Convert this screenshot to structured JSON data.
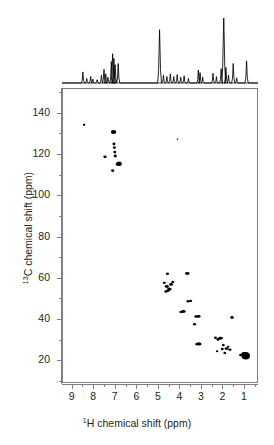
{
  "figure": {
    "title": "",
    "type": "2D HSQC NMR spectrum"
  },
  "axes": {
    "x": {
      "label_pre": "",
      "label_sup": "1",
      "label_main": "H chemical shift (ppm)",
      "label_full": "1H chemical shift (ppm)",
      "ticks": [
        9,
        8,
        7,
        6,
        5,
        4,
        3,
        2,
        1
      ],
      "tick_labels": [
        "9",
        "8",
        "7",
        "6",
        "5",
        "4",
        "3",
        "2",
        "1"
      ],
      "min": 9.45,
      "max": 0.35,
      "reversed": true,
      "minor_between": 1
    },
    "y": {
      "label_sup": "13",
      "label_main": "C chemical shift (ppm)",
      "label_full": "13C chemical shift (ppm)",
      "ticks": [
        20,
        40,
        60,
        80,
        100,
        120,
        140
      ],
      "tick_labels": [
        "20",
        "40",
        "60",
        "80",
        "100",
        "120",
        "140"
      ],
      "min": 9,
      "max": 152,
      "reversed": true,
      "minor_between": 1
    }
  },
  "chart_data": {
    "type": "scatter",
    "title": "",
    "xlabel": "1H chemical shift (ppm)",
    "ylabel": "13C chemical shift (ppm)",
    "xlim": [
      9.45,
      0.35
    ],
    "ylim": [
      152,
      9
    ],
    "grid": false,
    "legend": "none",
    "cross_peaks": [
      {
        "h": 0.88,
        "c": 21.8,
        "w": 8.5,
        "ht": 7.5
      },
      {
        "h": 0.95,
        "c": 22.4,
        "w": 6.0,
        "ht": 5.0
      },
      {
        "h": 0.8,
        "c": 22.0,
        "w": 5.0,
        "ht": 4.0
      },
      {
        "h": 1.12,
        "c": 22.2,
        "w": 3.0,
        "ht": 2.6
      },
      {
        "h": 1.52,
        "c": 40.5,
        "w": 3.6,
        "ht": 3.0
      },
      {
        "h": 1.62,
        "c": 24.8,
        "w": 3.2,
        "ht": 2.4
      },
      {
        "h": 1.78,
        "c": 25.3,
        "w": 4.2,
        "ht": 2.6
      },
      {
        "h": 1.7,
        "c": 26.2,
        "w": 2.6,
        "ht": 2.2
      },
      {
        "h": 1.86,
        "c": 23.2,
        "w": 2.8,
        "ht": 2.4
      },
      {
        "h": 1.93,
        "c": 27.0,
        "w": 3.0,
        "ht": 2.4
      },
      {
        "h": 1.98,
        "c": 25.1,
        "w": 3.0,
        "ht": 2.4
      },
      {
        "h": 2.06,
        "c": 30.4,
        "w": 5.0,
        "ht": 3.0
      },
      {
        "h": 2.18,
        "c": 29.8,
        "w": 3.2,
        "ht": 2.6
      },
      {
        "h": 2.22,
        "c": 24.0,
        "w": 2.6,
        "ht": 2.2
      },
      {
        "h": 2.3,
        "c": 30.6,
        "w": 3.0,
        "ht": 2.4
      },
      {
        "h": 3.08,
        "c": 27.6,
        "w": 5.5,
        "ht": 3.2
      },
      {
        "h": 3.18,
        "c": 27.5,
        "w": 3.0,
        "ht": 2.4
      },
      {
        "h": 3.1,
        "c": 41.0,
        "w": 4.5,
        "ht": 2.8
      },
      {
        "h": 3.22,
        "c": 41.0,
        "w": 3.0,
        "ht": 2.4
      },
      {
        "h": 3.28,
        "c": 37.2,
        "w": 3.2,
        "ht": 2.6
      },
      {
        "h": 3.46,
        "c": 48.6,
        "w": 3.0,
        "ht": 2.4
      },
      {
        "h": 3.58,
        "c": 48.4,
        "w": 3.2,
        "ht": 2.4
      },
      {
        "h": 3.62,
        "c": 62.0,
        "w": 4.5,
        "ht": 3.0
      },
      {
        "h": 3.8,
        "c": 43.4,
        "w": 4.5,
        "ht": 2.8
      },
      {
        "h": 3.92,
        "c": 43.2,
        "w": 3.0,
        "ht": 2.4
      },
      {
        "h": 4.3,
        "c": 57.8,
        "w": 3.0,
        "ht": 2.4
      },
      {
        "h": 4.38,
        "c": 56.6,
        "w": 4.0,
        "ht": 2.8
      },
      {
        "h": 4.46,
        "c": 54.4,
        "w": 4.6,
        "ht": 3.2
      },
      {
        "h": 4.52,
        "c": 53.6,
        "w": 3.6,
        "ht": 2.8
      },
      {
        "h": 4.58,
        "c": 55.6,
        "w": 4.2,
        "ht": 3.0
      },
      {
        "h": 4.62,
        "c": 53.2,
        "w": 3.2,
        "ht": 2.6
      },
      {
        "h": 4.55,
        "c": 61.8,
        "w": 3.2,
        "ht": 2.6
      },
      {
        "h": 4.7,
        "c": 57.4,
        "w": 3.0,
        "ht": 2.4
      },
      {
        "h": 6.82,
        "c": 115.5,
        "w": 5.5,
        "ht": 4.5
      },
      {
        "h": 6.9,
        "c": 115.3,
        "w": 3.2,
        "ht": 2.6
      },
      {
        "h": 7.0,
        "c": 119.3,
        "w": 3.2,
        "ht": 2.8
      },
      {
        "h": 7.02,
        "c": 121.2,
        "w": 3.0,
        "ht": 2.6
      },
      {
        "h": 7.04,
        "c": 123.4,
        "w": 3.0,
        "ht": 2.6
      },
      {
        "h": 7.06,
        "c": 125.2,
        "w": 3.0,
        "ht": 2.6
      },
      {
        "h": 7.08,
        "c": 131.0,
        "w": 5.5,
        "ht": 4.0
      },
      {
        "h": 7.12,
        "c": 112.2,
        "w": 3.2,
        "ht": 2.8
      },
      {
        "h": 7.48,
        "c": 118.9,
        "w": 3.4,
        "ht": 2.8
      },
      {
        "h": 8.46,
        "c": 134.5,
        "w": 2.6,
        "ht": 2.2
      },
      {
        "h": 4.08,
        "c": 127.5,
        "w": 1.6,
        "ht": 1.4
      }
    ],
    "projection_1d": {
      "axis": "1H",
      "description": "1D proton projection trace above the 2D plot",
      "peaks": [
        {
          "h": 8.48,
          "rel_intensity": 0.17
        },
        {
          "h": 8.3,
          "rel_intensity": 0.07
        },
        {
          "h": 8.12,
          "rel_intensity": 0.1
        },
        {
          "h": 8.02,
          "rel_intensity": 0.06
        },
        {
          "h": 7.82,
          "rel_intensity": 0.05
        },
        {
          "h": 7.62,
          "rel_intensity": 0.12
        },
        {
          "h": 7.5,
          "rel_intensity": 0.21
        },
        {
          "h": 7.42,
          "rel_intensity": 0.14
        },
        {
          "h": 7.32,
          "rel_intensity": 0.09
        },
        {
          "h": 7.16,
          "rel_intensity": 0.33
        },
        {
          "h": 7.1,
          "rel_intensity": 0.45
        },
        {
          "h": 7.04,
          "rel_intensity": 0.38
        },
        {
          "h": 6.98,
          "rel_intensity": 0.28
        },
        {
          "h": 6.84,
          "rel_intensity": 0.3
        },
        {
          "h": 4.92,
          "rel_intensity": 0.82
        },
        {
          "h": 4.74,
          "rel_intensity": 0.12
        },
        {
          "h": 4.58,
          "rel_intensity": 0.1
        },
        {
          "h": 4.42,
          "rel_intensity": 0.14
        },
        {
          "h": 4.26,
          "rel_intensity": 0.1
        },
        {
          "h": 4.1,
          "rel_intensity": 0.13
        },
        {
          "h": 3.94,
          "rel_intensity": 0.09
        },
        {
          "h": 3.78,
          "rel_intensity": 0.11
        },
        {
          "h": 3.58,
          "rel_intensity": 0.07
        },
        {
          "h": 3.12,
          "rel_intensity": 0.2
        },
        {
          "h": 3.04,
          "rel_intensity": 0.16
        },
        {
          "h": 2.92,
          "rel_intensity": 0.09
        },
        {
          "h": 2.44,
          "rel_intensity": 0.15
        },
        {
          "h": 2.28,
          "rel_intensity": 0.1
        },
        {
          "h": 2.06,
          "rel_intensity": 0.22
        },
        {
          "h": 1.94,
          "rel_intensity": 1.0
        },
        {
          "h": 1.84,
          "rel_intensity": 0.24
        },
        {
          "h": 1.72,
          "rel_intensity": 0.12
        },
        {
          "h": 1.5,
          "rel_intensity": 0.3
        },
        {
          "h": 1.34,
          "rel_intensity": 0.08
        },
        {
          "h": 0.88,
          "rel_intensity": 0.34
        }
      ]
    }
  },
  "colors": {
    "ink": "#231f20",
    "axis": "#808080",
    "peak": "#000000",
    "background": "#ffffff"
  }
}
